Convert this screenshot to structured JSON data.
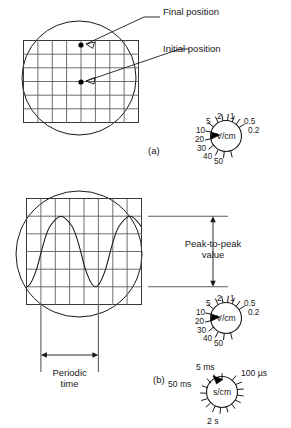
{
  "figure": {
    "panels": [
      {
        "id": "a",
        "label": "(a)",
        "description": "Spot deflection display"
      },
      {
        "id": "b",
        "label": "(b)",
        "description": "Sinusoidal waveform display"
      }
    ]
  },
  "panel_a": {
    "label": "(a)",
    "annotations": [
      {
        "name": "final-position",
        "text": "Final position"
      },
      {
        "name": "initial-position",
        "text": "Initial position"
      }
    ],
    "graticule": {
      "columns": 8,
      "rows": 6
    },
    "points": [
      {
        "name": "final-position-dot",
        "col": 4,
        "row": 0
      },
      {
        "name": "initial-position-dot",
        "col": 4,
        "row": 3
      }
    ]
  },
  "panel_b": {
    "label": "(b)",
    "annotations": [
      {
        "name": "peak-to-peak",
        "line1": "Peak-to-peak",
        "line2": "value"
      },
      {
        "name": "periodic-time",
        "line1": "Periodic",
        "line2": "time"
      }
    ],
    "graticule": {
      "columns": 8,
      "rows": 6
    },
    "waveform": {
      "type": "sine",
      "cycles": 2,
      "peak_to_peak_divisions": 4,
      "period_divisions": 4
    }
  },
  "volts_dial_a": {
    "name": "volts-per-cm-dial-a",
    "unit": "V/cm",
    "selected": "20",
    "settings": [
      "0.2",
      "0.5",
      "1",
      "2",
      "5",
      "10",
      "20",
      "30",
      "40",
      "50"
    ]
  },
  "volts_dial_b": {
    "name": "volts-per-cm-dial-b",
    "unit": "V/cm",
    "selected": "20",
    "settings": [
      "0.2",
      "0.5",
      "1",
      "2",
      "5",
      "10",
      "20",
      "30",
      "40",
      "50"
    ]
  },
  "time_dial": {
    "name": "seconds-per-cm-dial",
    "unit": "s/cm",
    "selected": "5 ms",
    "settings": [
      "100 µs",
      "5 ms",
      "50 ms",
      "2 s"
    ]
  },
  "colors": {
    "ink": "#1a1a1a",
    "grid": "#5d5d5d",
    "dimension": "#5d5d5d",
    "background": "#ffffff"
  }
}
